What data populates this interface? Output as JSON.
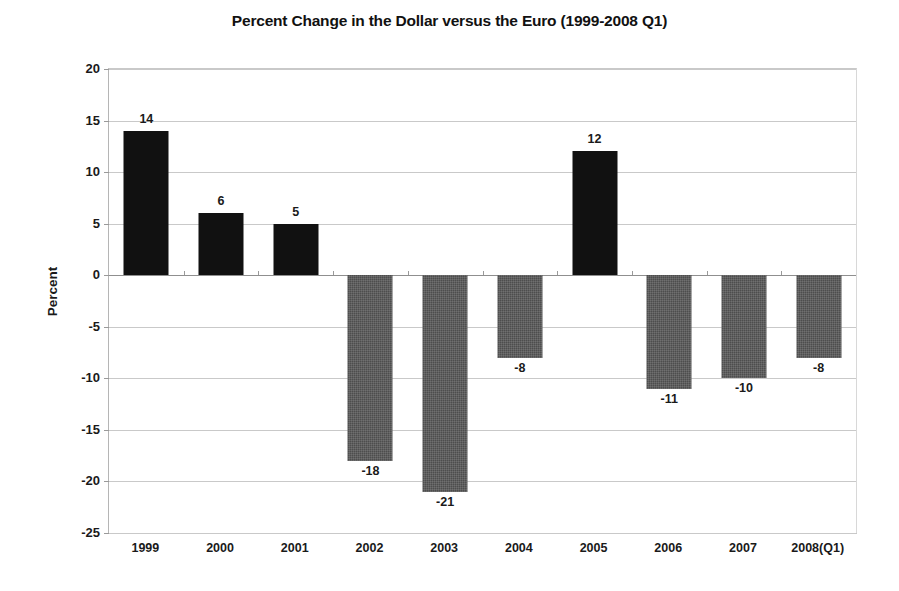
{
  "chart_data": {
    "type": "bar",
    "title": "Percent Change in the Dollar versus the Euro (1999-2008 Q1)",
    "xlabel": "",
    "ylabel": "Percent",
    "categories": [
      "1999",
      "2000",
      "2001",
      "2002",
      "2003",
      "2004",
      "2005",
      "2006",
      "2007",
      "2008(Q1)"
    ],
    "values": [
      14,
      6,
      5,
      -18,
      -21,
      -8,
      12,
      -11,
      -10,
      -8
    ],
    "data_labels": [
      "14",
      "6",
      "5",
      "-18",
      "-21",
      "-8",
      "12",
      "-11",
      "-10",
      "-8"
    ],
    "ylim": [
      -25,
      20
    ],
    "ytick_labels": [
      "20",
      "15",
      "10",
      "5",
      "0",
      "-5",
      "-10",
      "-15",
      "-20",
      "-25"
    ],
    "ytick_values": [
      20,
      15,
      10,
      5,
      0,
      -5,
      -10,
      -15,
      -20,
      -25
    ],
    "grid": true,
    "legend": null,
    "colors": {
      "positive_bar": "#111111",
      "negative_bar": "#4d4d4d",
      "gridline": "#c9c9c9",
      "zero_line": "#8f8f8f",
      "axis": "#b5b5b5",
      "text": "#1a1a1a",
      "background": "#ffffff"
    }
  }
}
